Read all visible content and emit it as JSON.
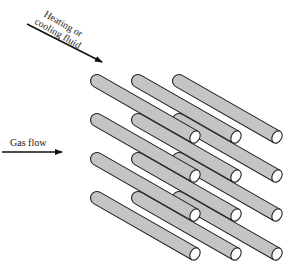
{
  "labels": {
    "heating_fluid_line1": "Heating or",
    "heating_fluid_line2": "cooling fluid",
    "gas_flow": "Gas flow"
  },
  "arrows": {
    "heating_fluid": {
      "x1": 27,
      "y1": 24,
      "x2": 102,
      "y2": 62
    },
    "gas_flow": {
      "x1": 2,
      "y1": 152,
      "x2": 62,
      "y2": 152
    }
  },
  "colors": {
    "cylinder_fill": "#c4c4c4",
    "cylinder_stroke": "#222222",
    "end_fill": "#ffffff",
    "arrow": "#111111"
  },
  "tube_bank": {
    "columns_back_x": [
      97,
      138,
      179
    ],
    "rows_back_y": [
      81,
      120,
      159,
      198
    ],
    "length_dx": 98,
    "length_dy": 56,
    "radius": 6.5
  }
}
